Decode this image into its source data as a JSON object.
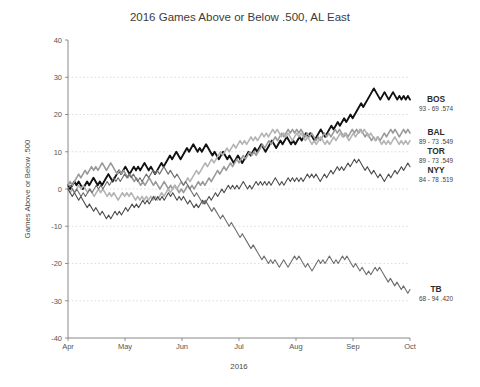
{
  "chart_data": {
    "type": "line",
    "title": "2016 Games Above or Below .500, AL East",
    "xlabel": "2016",
    "ylabel": "Games Above or Below .500",
    "ylim": [
      -40,
      40
    ],
    "yticks": [
      40,
      30,
      20,
      10,
      0,
      -10,
      -20,
      -30,
      -40
    ],
    "xticks": [
      "Apr",
      "May",
      "Jun",
      "Jul",
      "Aug",
      "Sep",
      "Oct"
    ],
    "grid": true,
    "legend_position": "right",
    "x_description": "Game number over the 2016 regular season, April through early October",
    "series": [
      {
        "name": "BOS",
        "label": "BOS",
        "record": "93 - 69  .574",
        "wins": 93,
        "losses": 69,
        "pct": ".574",
        "color": "#111111",
        "width": 1.9,
        "final_value": 24,
        "values": [
          1,
          0,
          1,
          2,
          1,
          2,
          1,
          0,
          1,
          2,
          1,
          2,
          3,
          2,
          1,
          2,
          1,
          2,
          3,
          4,
          3,
          2,
          3,
          4,
          5,
          4,
          5,
          6,
          5,
          4,
          5,
          6,
          5,
          6,
          5,
          6,
          7,
          6,
          5,
          6,
          5,
          4,
          5,
          6,
          7,
          6,
          7,
          8,
          9,
          8,
          9,
          10,
          9,
          8,
          9,
          10,
          11,
          10,
          11,
          12,
          11,
          10,
          11,
          10,
          11,
          12,
          11,
          10,
          9,
          10,
          9,
          8,
          9,
          10,
          9,
          8,
          9,
          8,
          7,
          8,
          9,
          8,
          7,
          8,
          9,
          10,
          9,
          10,
          11,
          10,
          11,
          12,
          11,
          10,
          11,
          12,
          13,
          12,
          11,
          12,
          13,
          12,
          13,
          14,
          13,
          12,
          13,
          12,
          13,
          14,
          13,
          14,
          15,
          14,
          15,
          14,
          13,
          14,
          15,
          16,
          15,
          14,
          15,
          16,
          17,
          16,
          17,
          18,
          17,
          18,
          19,
          18,
          19,
          20,
          19,
          20,
          21,
          22,
          23,
          22,
          23,
          24,
          25,
          26,
          27,
          26,
          25,
          24,
          25,
          26,
          25,
          24,
          25,
          26,
          25,
          24,
          25,
          24,
          25,
          24,
          25,
          24
        ]
      },
      {
        "name": "BAL",
        "label": "BAL",
        "record": "89 - 73  .549",
        "wins": 89,
        "losses": 73,
        "pct": ".549",
        "color": "#9a9a9a",
        "width": 1.6,
        "final_value": 15,
        "values": [
          1,
          2,
          1,
          2,
          3,
          4,
          3,
          4,
          5,
          4,
          5,
          6,
          5,
          6,
          5,
          6,
          7,
          6,
          5,
          6,
          7,
          6,
          5,
          4,
          5,
          4,
          5,
          4,
          3,
          4,
          3,
          2,
          3,
          2,
          1,
          2,
          1,
          2,
          3,
          2,
          1,
          2,
          1,
          0,
          1,
          2,
          1,
          0,
          1,
          0,
          1,
          0,
          -1,
          0,
          -1,
          0,
          1,
          0,
          1,
          0,
          1,
          2,
          1,
          2,
          1,
          2,
          3,
          2,
          3,
          4,
          5,
          4,
          5,
          6,
          5,
          6,
          7,
          6,
          7,
          8,
          7,
          8,
          9,
          8,
          9,
          10,
          9,
          10,
          9,
          10,
          11,
          12,
          11,
          12,
          13,
          12,
          13,
          14,
          13,
          14,
          15,
          14,
          15,
          16,
          15,
          16,
          15,
          16,
          15,
          16,
          15,
          14,
          15,
          14,
          15,
          14,
          13,
          14,
          13,
          14,
          15,
          14,
          15,
          14,
          15,
          16,
          15,
          16,
          15,
          14,
          15,
          14,
          15,
          16,
          15,
          16,
          15,
          16,
          15,
          14,
          15,
          14,
          13,
          14,
          13,
          14,
          13,
          14,
          15,
          14,
          15,
          16,
          15,
          16,
          15,
          14,
          15,
          16,
          15,
          16,
          15
        ]
      },
      {
        "name": "TOR",
        "label": "TOR",
        "record": "89 - 73  .549",
        "wins": 89,
        "losses": 73,
        "pct": ".549",
        "color": "#b4b4b4",
        "width": 1.6,
        "final_value": 13,
        "values": [
          0,
          -1,
          0,
          -1,
          0,
          1,
          0,
          1,
          0,
          -1,
          0,
          -1,
          -2,
          -1,
          0,
          -1,
          0,
          -1,
          -2,
          -1,
          -2,
          -1,
          -2,
          -3,
          -2,
          -1,
          -2,
          -1,
          -2,
          -1,
          -2,
          -3,
          -2,
          -3,
          -2,
          -3,
          -2,
          -3,
          -2,
          -3,
          -2,
          -3,
          -2,
          -1,
          -2,
          -1,
          0,
          -1,
          0,
          1,
          0,
          1,
          2,
          1,
          2,
          3,
          2,
          3,
          4,
          5,
          4,
          5,
          6,
          7,
          6,
          7,
          8,
          7,
          8,
          9,
          10,
          9,
          10,
          11,
          10,
          11,
          12,
          11,
          12,
          13,
          12,
          13,
          12,
          13,
          14,
          13,
          14,
          13,
          14,
          15,
          14,
          15,
          14,
          15,
          16,
          15,
          16,
          15,
          14,
          15,
          14,
          15,
          14,
          13,
          14,
          15,
          14,
          15,
          14,
          13,
          14,
          13,
          12,
          13,
          12,
          13,
          14,
          13,
          12,
          13,
          12,
          13,
          14,
          13,
          14,
          15,
          14,
          15,
          14,
          13,
          14,
          15,
          14,
          15,
          16,
          15,
          16,
          15,
          14,
          15,
          14,
          13,
          14,
          13,
          12,
          13,
          12,
          13,
          12,
          13,
          14,
          13,
          12,
          13,
          12,
          13,
          12,
          13
        ]
      },
      {
        "name": "NYY",
        "label": "NYY",
        "record": "84 - 78  .519",
        "wins": 84,
        "losses": 78,
        "pct": ".519",
        "color": "#4d4d4d",
        "width": 1.1,
        "final_value": 6,
        "values": [
          0,
          -1,
          -2,
          -1,
          -2,
          -3,
          -2,
          -3,
          -4,
          -5,
          -4,
          -5,
          -6,
          -5,
          -6,
          -7,
          -6,
          -7,
          -8,
          -7,
          -8,
          -7,
          -6,
          -7,
          -6,
          -7,
          -6,
          -5,
          -6,
          -5,
          -4,
          -5,
          -4,
          -5,
          -4,
          -3,
          -4,
          -3,
          -4,
          -3,
          -2,
          -3,
          -2,
          -3,
          -2,
          -3,
          -2,
          -1,
          -2,
          -1,
          -2,
          -3,
          -2,
          -3,
          -2,
          -3,
          -4,
          -3,
          -4,
          -5,
          -4,
          -5,
          -4,
          -3,
          -4,
          -3,
          -2,
          -3,
          -2,
          -1,
          -2,
          -1,
          0,
          -1,
          0,
          1,
          0,
          1,
          0,
          1,
          0,
          1,
          2,
          1,
          0,
          1,
          0,
          1,
          2,
          1,
          2,
          1,
          2,
          1,
          2,
          1,
          2,
          3,
          2,
          1,
          2,
          1,
          2,
          3,
          2,
          3,
          2,
          3,
          2,
          3,
          2,
          3,
          4,
          3,
          4,
          3,
          4,
          3,
          2,
          3,
          4,
          3,
          4,
          5,
          4,
          5,
          6,
          5,
          6,
          5,
          6,
          7,
          6,
          7,
          8,
          7,
          8,
          7,
          6,
          5,
          6,
          5,
          4,
          5,
          4,
          3,
          4,
          3,
          2,
          3,
          4,
          3,
          4,
          5,
          4,
          5,
          6,
          5,
          6,
          7,
          6
        ]
      },
      {
        "name": "TB",
        "label": "TB",
        "record": "68 - 94  .420",
        "wins": 68,
        "losses": 94,
        "pct": ".420",
        "color": "#6e6e6e",
        "width": 1.1,
        "final_value": -27,
        "values": [
          0,
          1,
          0,
          -1,
          0,
          -1,
          -2,
          -1,
          -2,
          -1,
          0,
          -1,
          0,
          1,
          0,
          1,
          0,
          1,
          2,
          1,
          2,
          3,
          2,
          3,
          2,
          3,
          4,
          3,
          4,
          3,
          4,
          3,
          2,
          3,
          2,
          3,
          4,
          3,
          4,
          5,
          4,
          5,
          4,
          5,
          6,
          5,
          4,
          5,
          4,
          3,
          4,
          3,
          2,
          1,
          2,
          1,
          0,
          -1,
          -2,
          -1,
          -2,
          -3,
          -4,
          -3,
          -4,
          -5,
          -6,
          -5,
          -6,
          -7,
          -8,
          -7,
          -8,
          -9,
          -10,
          -9,
          -10,
          -11,
          -12,
          -13,
          -12,
          -13,
          -14,
          -15,
          -16,
          -15,
          -16,
          -17,
          -18,
          -19,
          -18,
          -19,
          -20,
          -19,
          -20,
          -19,
          -20,
          -21,
          -20,
          -19,
          -20,
          -21,
          -20,
          -19,
          -18,
          -19,
          -18,
          -19,
          -20,
          -21,
          -20,
          -21,
          -22,
          -21,
          -20,
          -19,
          -20,
          -19,
          -20,
          -19,
          -18,
          -19,
          -20,
          -19,
          -20,
          -19,
          -18,
          -19,
          -18,
          -19,
          -20,
          -21,
          -20,
          -21,
          -22,
          -21,
          -22,
          -23,
          -22,
          -23,
          -22,
          -21,
          -22,
          -21,
          -22,
          -23,
          -24,
          -25,
          -24,
          -25,
          -26,
          -25,
          -26,
          -27,
          -26,
          -27,
          -28,
          -27
        ]
      }
    ]
  }
}
